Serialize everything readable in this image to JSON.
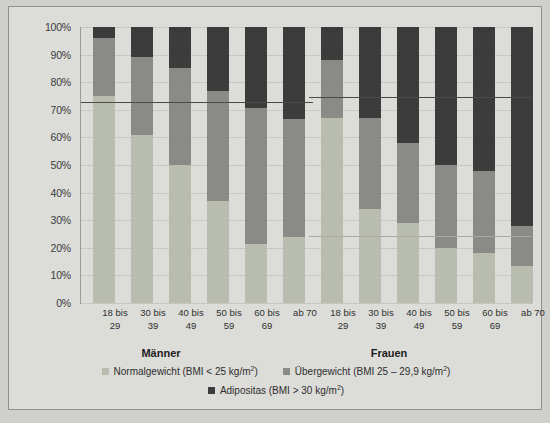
{
  "chart_data": {
    "type": "bar",
    "subtype": "stacked-percentage",
    "title": "",
    "xlabel": "",
    "ylabel": "",
    "ylim": [
      0,
      100
    ],
    "ytick_labels": [
      "0%",
      "10%",
      "20%",
      "30%",
      "40%",
      "50%",
      "60%",
      "70%",
      "80%",
      "90%",
      "100%"
    ],
    "ytick_values": [
      0,
      10,
      20,
      30,
      40,
      50,
      60,
      70,
      80,
      90,
      100
    ],
    "grid": true,
    "legend_position": "bottom",
    "groups": [
      {
        "name": "Männer",
        "categories": [
          "18 bis 29",
          "30 bis 39",
          "40 bis 49",
          "50 bis 59",
          "60 bis 69",
          "ab 70"
        ],
        "series": [
          {
            "name": "Normalgewicht (BMI < 25 kg/m2)",
            "values": [
              75,
              61,
              50,
              37,
              21.5,
              24
            ]
          },
          {
            "name": "Übergewicht (BMI 25 – 29,9 kg/m2)",
            "values": [
              21,
              28,
              35,
              40,
              49,
              42.5
            ]
          },
          {
            "name": "Adipositas (BMI > 30 kg/m2)",
            "values": [
              4,
              11,
              15,
              23,
              29.5,
              33.5
            ]
          }
        ],
        "reference_line": 73
      },
      {
        "name": "Frauen",
        "categories": [
          "18 bis 29",
          "30 bis 39",
          "40 bis 49",
          "50 bis 59",
          "60 bis 69",
          "ab 70"
        ],
        "series": [
          {
            "name": "Normalgewicht (BMI < 25 kg/m2)",
            "values": [
              67,
              34,
              29,
              20,
              18,
              13.5
            ]
          },
          {
            "name": "Übergewicht (BMI 25 – 29,9 kg/m2)",
            "values": [
              21,
              33,
              29,
              30,
              30,
              14.5
            ]
          },
          {
            "name": "Adipositas (BMI > 30 kg/m2)",
            "values": [
              12,
              33,
              42,
              50,
              52,
              72
            ]
          }
        ],
        "reference_line": 74.5,
        "reference_line_secondary": 24.3
      }
    ],
    "legend": [
      {
        "key": "norm",
        "label": "Normalgewicht (BMI < 25 kg/m",
        "unit_exp": "2",
        "label_tail": ")",
        "color": "#b9bdb0"
      },
      {
        "key": "uber",
        "label": "Übergewicht (BMI 25 – 29,9 kg/m",
        "unit_exp": "2",
        "label_tail": ")",
        "color": "#8a8a87"
      },
      {
        "key": "adip",
        "label": "Adipositas (BMI > 30 kg/m",
        "unit_exp": "2",
        "label_tail": ")",
        "color": "#3c3c3c"
      }
    ]
  },
  "colors": {
    "background": "#dcdcd8",
    "page": "#cfcfcb",
    "normalgewicht": "#b9bdb0",
    "uebergewicht": "#8a8a87",
    "adipositas": "#3c3c3c",
    "gridline": "#c6c6c2",
    "axis": "#9a9a96",
    "reference_line": "#4a4a4a"
  }
}
